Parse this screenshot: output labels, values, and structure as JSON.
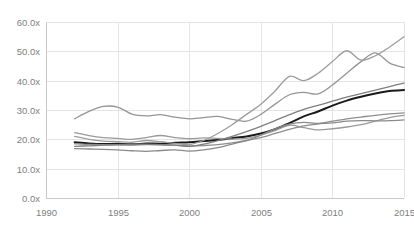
{
  "chart_data": {
    "type": "line",
    "title": "",
    "subtitle": "",
    "xlabel": "",
    "ylabel": "",
    "xlim": [
      1990,
      2015
    ],
    "ylim": [
      0,
      60
    ],
    "x_ticks": [
      1990,
      1995,
      2000,
      2005,
      2010,
      2015
    ],
    "x_tick_labels": [
      "1990",
      "1995",
      "2000",
      "2005",
      "2010",
      "2015"
    ],
    "y_ticks": [
      0,
      10,
      20,
      30,
      40,
      50,
      60
    ],
    "y_tick_labels": [
      "0.0x",
      "10.0x",
      "20.0x",
      "30.0x",
      "40.0x",
      "50.0x",
      "60.0x"
    ],
    "grid": true,
    "grid_axis": "both",
    "legend": false,
    "legend_position": "none",
    "x": [
      1992,
      1993,
      1994,
      1995,
      1996,
      1997,
      1998,
      1999,
      2000,
      2001,
      2002,
      2003,
      2004,
      2005,
      2006,
      2007,
      2008,
      2009,
      2010,
      2011,
      2012,
      2013,
      2014,
      2015
    ],
    "series": [
      {
        "name": "series-1-top",
        "color": "#959595",
        "width": 1.3,
        "values": [
          27.0,
          29.5,
          31.2,
          31.0,
          28.6,
          28.0,
          28.4,
          27.6,
          27.0,
          27.4,
          27.8,
          26.8,
          26.2,
          28.5,
          32.0,
          35.2,
          36.0,
          35.5,
          38.5,
          42.5,
          46.5,
          49.5,
          46.0,
          44.5
        ]
      },
      {
        "name": "series-2-black-bold",
        "color": "#1a1a1a",
        "width": 2.0,
        "values": [
          19.0,
          18.6,
          18.4,
          18.5,
          18.3,
          18.6,
          18.5,
          18.8,
          19.0,
          19.4,
          19.8,
          20.4,
          21.0,
          22.0,
          23.5,
          25.5,
          27.8,
          29.5,
          31.5,
          33.2,
          34.5,
          35.6,
          36.5,
          36.8
        ]
      },
      {
        "name": "series-3-mid",
        "color": "#9a9a9a",
        "width": 1.3,
        "values": [
          22.3,
          21.3,
          20.6,
          20.3,
          20.0,
          20.6,
          21.3,
          20.6,
          20.2,
          20.5,
          20.3,
          20.1,
          20.3,
          21.4,
          23.0,
          24.8,
          24.0,
          23.2,
          23.6,
          24.2,
          25.0,
          26.2,
          27.4,
          28.2
        ]
      },
      {
        "name": "series-4-mid-low",
        "color": "#8e8e8e",
        "width": 1.3,
        "values": [
          18.5,
          18.3,
          18.2,
          18.1,
          18.0,
          18.2,
          18.1,
          18.0,
          17.8,
          17.9,
          18.2,
          18.8,
          19.6,
          20.6,
          22.0,
          23.4,
          24.6,
          25.3,
          26.2,
          27.0,
          27.6,
          28.2,
          28.7,
          29.0
        ]
      },
      {
        "name": "series-5-bottom",
        "color": "#8a8a8a",
        "width": 1.3,
        "values": [
          16.8,
          16.7,
          16.6,
          16.4,
          16.1,
          15.9,
          16.2,
          16.4,
          16.0,
          16.4,
          17.2,
          18.4,
          19.6,
          21.4,
          23.6,
          25.2,
          25.8,
          25.4,
          25.6,
          26.2,
          26.4,
          26.3,
          26.4,
          26.6
        ]
      },
      {
        "name": "series-6-rising",
        "color": "#7f7f7f",
        "width": 1.3,
        "values": [
          17.6,
          17.8,
          18.0,
          18.2,
          18.3,
          18.4,
          18.2,
          18.0,
          17.6,
          18.4,
          19.6,
          21.0,
          22.6,
          24.4,
          26.4,
          28.4,
          30.2,
          31.6,
          33.0,
          34.4,
          35.6,
          36.8,
          38.0,
          39.2
        ]
      },
      {
        "name": "series-7-highest",
        "color": "#9d9d9d",
        "width": 1.3,
        "values": [
          21.0,
          20.0,
          19.4,
          19.2,
          19.0,
          19.6,
          19.2,
          18.6,
          18.2,
          19.6,
          22.0,
          25.0,
          28.5,
          32.0,
          36.5,
          41.5,
          40.0,
          42.5,
          46.5,
          50.2,
          47.0,
          48.5,
          51.5,
          55.0
        ]
      }
    ],
    "plot_area": {
      "left": 46,
      "right": 404,
      "top": 22,
      "bottom": 198
    },
    "background_color": "#ffffff",
    "grid_color": "#e4e4e4",
    "tick_label_color": "#808080"
  }
}
